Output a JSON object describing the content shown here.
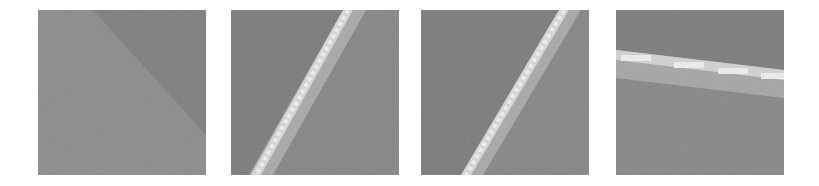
{
  "figure": {
    "panel_count": 4,
    "background": "#ffffff",
    "panels": [
      {
        "id": 1,
        "description": "noisy gray patch with faint diagonal edge (darker upper-right region)",
        "base_color": "#8a8a8a",
        "dark_color": "#7c7c7c"
      },
      {
        "id": 2,
        "description": "noisy gray patch with bright pixelated diagonal line, lower-left to upper-right",
        "base_color": "#858585",
        "line_color": "#e8e8e8",
        "halo_color": "#a9a9a9"
      },
      {
        "id": 3,
        "description": "noisy gray patch with bright pixelated diagonal line, lower-left to upper-right",
        "base_color": "#858585",
        "line_color": "#e8e8e8",
        "halo_color": "#a9a9a9"
      },
      {
        "id": 4,
        "description": "noisy gray patch with bright pixelated near-horizontal stripe, slight downward slope",
        "base_color": "#858585",
        "line_color": "#e8e8e8",
        "halo_color": "#a5a5a5"
      }
    ]
  }
}
